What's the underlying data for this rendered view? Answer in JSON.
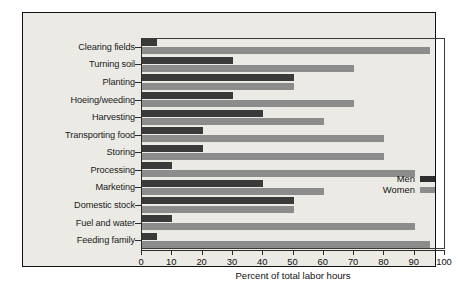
{
  "chart_data": {
    "type": "bar",
    "orientation": "horizontal",
    "title": "",
    "xlabel": "Percent of total labor hours",
    "ylabel": "",
    "xlim": [
      0,
      100
    ],
    "xticks": [
      0,
      10,
      20,
      30,
      40,
      50,
      60,
      70,
      80,
      90,
      100
    ],
    "grid": false,
    "legend_position": "inside-right",
    "categories": [
      "Clearing fields",
      "Turning soil",
      "Planting",
      "Hoeing/weeding",
      "Harvesting",
      "Transporting food",
      "Storing",
      "Processing",
      "Marketing",
      "Domestic stock",
      "Fuel and water",
      "Feeding family"
    ],
    "series": [
      {
        "name": "Men",
        "color": "#3a3a3a",
        "values": [
          5,
          30,
          50,
          30,
          40,
          20,
          20,
          10,
          40,
          50,
          10,
          5
        ]
      },
      {
        "name": "Women",
        "color": "#8c8c8c",
        "values": [
          95,
          70,
          50,
          70,
          60,
          80,
          80,
          90,
          60,
          50,
          90,
          95
        ]
      }
    ]
  },
  "legend": {
    "entries": [
      {
        "label": "Men",
        "swatch": "men-swatch"
      },
      {
        "label": "Women",
        "swatch": "women-swatch"
      }
    ]
  },
  "colors": {
    "men": "#3a3a3a",
    "women": "#8c8c8c",
    "panel_background": "#eceae5",
    "axis": "#2b2b2b",
    "frame": "#111111"
  }
}
